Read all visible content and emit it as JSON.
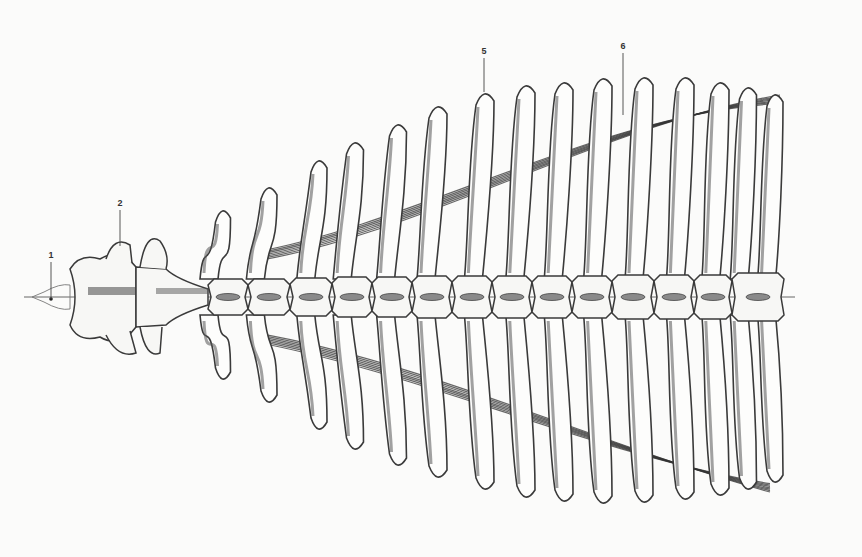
{
  "figure": {
    "background": "#fbfbfa",
    "ink_color": "#3a3a3a",
    "axis_y": 297,
    "axis_x_start": 24,
    "axis_x_end": 795
  },
  "labels": [
    {
      "id": "1",
      "text": "1",
      "x": 51,
      "y": 258,
      "line_x": 51,
      "line_y1": 262,
      "line_y2": 299
    },
    {
      "id": "2",
      "text": "2",
      "x": 120,
      "y": 206,
      "line_x": 120,
      "line_y1": 210,
      "line_y2": 246
    },
    {
      "id": "5",
      "text": "5",
      "x": 484,
      "y": 54,
      "line_x": 484,
      "line_y1": 58,
      "line_y2": 92
    },
    {
      "id": "6",
      "text": "6",
      "x": 623,
      "y": 49,
      "line_x": 623,
      "line_y1": 53,
      "line_y2": 115
    }
  ],
  "ribs": [
    {
      "x": 222,
      "top": 208,
      "bottom": 382,
      "w": 13
    },
    {
      "x": 268,
      "top": 185,
      "bottom": 405,
      "w": 14
    },
    {
      "x": 318,
      "top": 158,
      "bottom": 432,
      "w": 14
    },
    {
      "x": 354,
      "top": 140,
      "bottom": 452,
      "w": 15
    },
    {
      "x": 397,
      "top": 122,
      "bottom": 468,
      "w": 15
    },
    {
      "x": 437,
      "top": 104,
      "bottom": 480,
      "w": 16
    },
    {
      "x": 484,
      "top": 91,
      "bottom": 492,
      "w": 16
    },
    {
      "x": 525,
      "top": 83,
      "bottom": 500,
      "w": 16
    },
    {
      "x": 563,
      "top": 80,
      "bottom": 504,
      "w": 16
    },
    {
      "x": 602,
      "top": 76,
      "bottom": 506,
      "w": 16
    },
    {
      "x": 643,
      "top": 75,
      "bottom": 505,
      "w": 16
    },
    {
      "x": 684,
      "top": 75,
      "bottom": 502,
      "w": 16
    },
    {
      "x": 719,
      "top": 80,
      "bottom": 498,
      "w": 16
    },
    {
      "x": 747,
      "top": 85,
      "bottom": 492,
      "w": 15
    },
    {
      "x": 774,
      "top": 92,
      "bottom": 485,
      "w": 14
    }
  ],
  "vertebrae": [
    {
      "name": "atlas",
      "x": 70,
      "w": 66,
      "h": 60
    },
    {
      "name": "axis",
      "x": 136,
      "w": 72,
      "h": 50
    },
    {
      "name": "T",
      "x": 208,
      "w": 40,
      "h": 36
    },
    {
      "name": "T",
      "x": 248,
      "w": 42,
      "h": 36
    },
    {
      "name": "T",
      "x": 290,
      "w": 42,
      "h": 38
    },
    {
      "name": "T",
      "x": 332,
      "w": 40,
      "h": 40
    },
    {
      "name": "T",
      "x": 372,
      "w": 40,
      "h": 40
    },
    {
      "name": "T",
      "x": 412,
      "w": 40,
      "h": 42
    },
    {
      "name": "T",
      "x": 452,
      "w": 40,
      "h": 42
    },
    {
      "name": "T",
      "x": 492,
      "w": 40,
      "h": 42
    },
    {
      "name": "T",
      "x": 532,
      "w": 40,
      "h": 42
    },
    {
      "name": "T",
      "x": 572,
      "w": 40,
      "h": 42
    },
    {
      "name": "T",
      "x": 612,
      "w": 42,
      "h": 44
    },
    {
      "name": "T",
      "x": 654,
      "w": 40,
      "h": 44
    },
    {
      "name": "T",
      "x": 694,
      "w": 38,
      "h": 44
    },
    {
      "name": "L",
      "x": 732,
      "w": 52,
      "h": 48
    }
  ]
}
